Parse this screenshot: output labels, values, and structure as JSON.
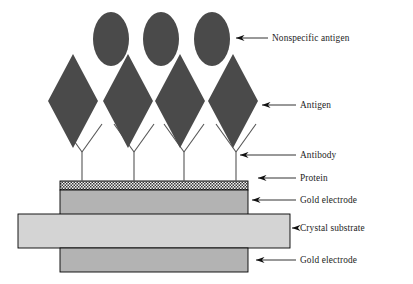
{
  "figure": {
    "width": 413,
    "height": 284,
    "background": "#ffffff"
  },
  "colors": {
    "antigen_fill": "#4a4a4a",
    "nonspecific_antigen_fill": "#4a4a4a",
    "protein_fill": "#555555",
    "gold_electrode_fill": "#b3b3b3",
    "crystal_substrate_fill": "#d4d4d4",
    "outline": "#000000",
    "antibody_stroke": "#555555",
    "label_text": "#1c1c1c",
    "leader_line": "#1c1c1c"
  },
  "labels": [
    {
      "id": "nonspecific-antigen",
      "text": "Nonspecific antigen",
      "x": 272,
      "y": 41
    },
    {
      "id": "antigen",
      "text": "Antigen",
      "x": 300,
      "y": 108
    },
    {
      "id": "antibody",
      "text": "Antibody",
      "x": 300,
      "y": 158
    },
    {
      "id": "protein",
      "text": "Protein",
      "x": 300,
      "y": 181
    },
    {
      "id": "gold-electrode-top",
      "text": "Gold electrode",
      "x": 300,
      "y": 203
    },
    {
      "id": "crystal-substrate",
      "text": "Crystal substrate",
      "x": 300,
      "y": 231
    },
    {
      "id": "gold-electrode-bottom",
      "text": "Gold electrode",
      "x": 300,
      "y": 263
    }
  ],
  "leaders": [
    {
      "id": "leader-nonspecific-antigen",
      "tip_x": 236,
      "tip_y": 38,
      "end_x": 268,
      "end_y": 38
    },
    {
      "id": "leader-antigen",
      "tip_x": 262,
      "tip_y": 105,
      "end_x": 296,
      "end_y": 105
    },
    {
      "id": "leader-antibody",
      "tip_x": 240,
      "tip_y": 155,
      "end_x": 296,
      "end_y": 155
    },
    {
      "id": "leader-protein",
      "tip_x": 258,
      "tip_y": 178,
      "end_x": 296,
      "end_y": 178
    },
    {
      "id": "leader-gold-electrode-top",
      "tip_x": 252,
      "tip_y": 200,
      "end_x": 296,
      "end_y": 200
    },
    {
      "id": "leader-crystal-substrate",
      "tip_x": 292,
      "tip_y": 228,
      "end_x": 296,
      "end_y": 228
    },
    {
      "id": "leader-gold-electrode-bottom",
      "tip_x": 256,
      "tip_y": 260,
      "end_x": 296,
      "end_y": 260
    }
  ],
  "layers": [
    {
      "id": "protein-layer",
      "label": "Protein",
      "x": 60,
      "y": 181,
      "width": 188,
      "height": 9,
      "fill": "#555555",
      "pattern": "checkerboard"
    },
    {
      "id": "gold-electrode-top",
      "label": "Gold electrode",
      "x": 60,
      "y": 190,
      "width": 188,
      "height": 25,
      "fill": "#b3b3b3",
      "pattern": "solid"
    },
    {
      "id": "crystal-substrate",
      "label": "Crystal substrate",
      "x": 18,
      "y": 214,
      "width": 272,
      "height": 34,
      "fill": "#d4d4d4",
      "pattern": "solid"
    },
    {
      "id": "gold-electrode-bottom",
      "label": "Gold electrode",
      "x": 60,
      "y": 248,
      "width": 188,
      "height": 24,
      "fill": "#b3b3b3",
      "pattern": "solid"
    }
  ],
  "antigens": [
    {
      "id": "antigen-1",
      "cx": 73,
      "cy": 101,
      "rx": 25,
      "ry": 47
    },
    {
      "id": "antigen-2",
      "cx": 128,
      "cy": 101,
      "rx": 25,
      "ry": 47
    },
    {
      "id": "antigen-3",
      "cx": 180,
      "cy": 101,
      "rx": 25,
      "ry": 47
    },
    {
      "id": "antigen-4",
      "cx": 233,
      "cy": 101,
      "rx": 25,
      "ry": 47
    }
  ],
  "nonspecific_antigens": [
    {
      "id": "nonspecific-antigen-1",
      "cx": 111,
      "cy": 39,
      "rx": 18,
      "ry": 27
    },
    {
      "id": "nonspecific-antigen-2",
      "cx": 161,
      "cy": 39,
      "rx": 18,
      "ry": 27
    },
    {
      "id": "nonspecific-antigen-3",
      "cx": 212,
      "cy": 39,
      "rx": 18,
      "ry": 27
    }
  ],
  "antibodies": [
    {
      "id": "antibody-1",
      "stem_x": 82,
      "stem_top": 152,
      "stem_bottom": 181,
      "arm_span": 20,
      "arm_top": 124
    },
    {
      "id": "antibody-2",
      "stem_x": 134,
      "stem_top": 152,
      "stem_bottom": 181,
      "arm_span": 20,
      "arm_top": 124
    },
    {
      "id": "antibody-3",
      "stem_x": 184,
      "stem_top": 152,
      "stem_bottom": 181,
      "arm_span": 20,
      "arm_top": 124
    },
    {
      "id": "antibody-4",
      "stem_x": 236,
      "stem_top": 152,
      "stem_bottom": 181,
      "arm_span": 20,
      "arm_top": 124
    }
  ]
}
